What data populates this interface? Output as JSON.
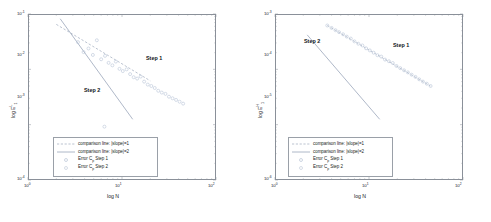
{
  "figure": {
    "background": "#ffffff",
    "axis_color": "#8a9099",
    "marker_color": "#b9c4d6",
    "line1_color": "#aab4c4",
    "line2_color": "#9aa6ba"
  },
  "panels": [
    {
      "id": "left",
      "xlabel": "log N",
      "ylabel_text": "log E",
      "ylabel_sup": "L",
      "ylabel_sub": "1",
      "xticks": [
        "10",
        "10",
        "10"
      ],
      "xtick_exponents": [
        "0",
        "1",
        "2"
      ],
      "yticks": [
        "10",
        "10",
        "10",
        "10"
      ],
      "ytick_exponents": [
        "-1",
        "-2",
        "-3",
        "-4"
      ],
      "annotations": [
        {
          "name": "step-1-annotation",
          "label": "Step 1"
        },
        {
          "name": "step-2-annotation",
          "label": "Step 2"
        }
      ],
      "legend": [
        {
          "label": "comparison line: |slope|=1",
          "key": "dashed-line-key"
        },
        {
          "label": "comparison line: |slope|=2",
          "key": "solid-line-key"
        },
        {
          "label_pre": "Error C",
          "label_sub": "p",
          "label_post": " Step 1",
          "key": "circle-marker-key"
        },
        {
          "label_pre": "Error C",
          "label_sub": "p",
          "label_post": " Step 2",
          "key": "circle-marker-key"
        }
      ]
    },
    {
      "id": "right",
      "xlabel": "log N",
      "ylabel_text": "log E",
      "ylabel_sup": "H",
      "ylabel_sub": "1",
      "xticks": [
        "10",
        "10",
        "10"
      ],
      "xtick_exponents": [
        "0",
        "1",
        "2"
      ],
      "yticks": [
        "10",
        "10",
        "10",
        "10"
      ],
      "ytick_exponents": [
        "-3",
        "-4",
        "-5",
        "-6"
      ],
      "annotations": [
        {
          "name": "step-1-annotation",
          "label": "Step 1"
        },
        {
          "name": "step-2-annotation",
          "label": "Step 2"
        }
      ],
      "legend": [
        {
          "label": "comparison line: |slope|=1",
          "key": "dashed-line-key"
        },
        {
          "label": "comparison line: |slope|=2",
          "key": "solid-line-key"
        },
        {
          "label_pre": "Error C",
          "label_sub": "p",
          "label_post": " Step 1",
          "key": "circle-marker-key"
        },
        {
          "label_pre": "Error C",
          "label_sub": "p",
          "label_post": " Step 2",
          "key": "circle-marker-key"
        }
      ]
    }
  ],
  "chart_data": [
    {
      "type": "scatter",
      "title": "",
      "xlabel": "log N",
      "ylabel": "log E^L_1",
      "xscale": "log",
      "yscale": "log",
      "xlim": [
        1,
        100
      ],
      "ylim": [
        0.0001,
        0.1
      ],
      "grid": false,
      "legend_position": "lower-left-inside",
      "annotations": [
        {
          "text": "Step 1",
          "x": 18,
          "y": 0.018
        },
        {
          "text": "Step 2",
          "x": 4.2,
          "y": 0.0075
        }
      ],
      "series": [
        {
          "name": "comparison line: |slope|=1",
          "type": "line",
          "style": "dashed",
          "x": [
            2.0,
            20.0
          ],
          "y": [
            0.065,
            0.0062
          ]
        },
        {
          "name": "comparison line: |slope|=2",
          "type": "line",
          "style": "solid",
          "x": [
            2.2,
            13.0
          ],
          "y": [
            0.082,
            0.00125
          ]
        },
        {
          "name": "Error C_p Step 1",
          "type": "scatter",
          "marker": "circle",
          "x": [
            3.4,
            3.9,
            4.4,
            4.9,
            5.4,
            6.0,
            6.6,
            7.2,
            7.9,
            8.6,
            9.4,
            10.2,
            11.2,
            12.2,
            13.3,
            14.5,
            15.8,
            17.2,
            18.8,
            20.5,
            22.3,
            24.3,
            26.5,
            29.0,
            31.6,
            34.5,
            37.6,
            41.0,
            44.7
          ],
          "y": [
            0.031,
            0.0205,
            0.0238,
            0.0182,
            0.0335,
            0.0152,
            0.0175,
            0.0131,
            0.0118,
            0.0138,
            0.0102,
            0.0093,
            0.01,
            0.0082,
            0.0072,
            0.0068,
            0.0074,
            0.006,
            0.0053,
            0.005,
            0.0046,
            0.0041,
            0.0038,
            0.0036,
            0.0032,
            0.003,
            0.0028,
            0.0026,
            0.0024
          ]
        },
        {
          "name": "Error C_p Step 2",
          "type": "scatter",
          "marker": "circle",
          "x": [
            6.5,
            9.0,
            11.5
          ],
          "y": [
            0.00092,
            0.00046,
            0.0003
          ]
        }
      ]
    },
    {
      "type": "scatter",
      "title": "",
      "xlabel": "log N",
      "ylabel": "log E^H_1",
      "xscale": "log",
      "yscale": "log",
      "xlim": [
        1,
        100
      ],
      "ylim": [
        1e-06,
        0.001
      ],
      "grid": false,
      "legend_position": "lower-left-inside",
      "annotations": [
        {
          "text": "Step 1",
          "x": 16,
          "y": 0.00035
        },
        {
          "text": "Step 2",
          "x": 2.6,
          "y": 0.0004
        }
      ],
      "series": [
        {
          "name": "comparison line: |slope|=1",
          "type": "line",
          "style": "dashed",
          "x": [
            3.6,
            45.0
          ],
          "y": [
            0.00062,
            5e-05
          ]
        },
        {
          "name": "comparison line: |slope|=2",
          "type": "line",
          "style": "solid",
          "x": [
            2.2,
            13.0
          ],
          "y": [
            0.00042,
            1.25e-05
          ]
        },
        {
          "name": "Error C_p Step 1",
          "type": "scatter",
          "marker": "circle",
          "x": [
            3.6,
            4.0,
            4.4,
            4.8,
            5.3,
            5.8,
            6.4,
            7.0,
            7.7,
            8.5,
            9.3,
            10.2,
            11.2,
            12.3,
            13.5,
            14.8,
            16.3,
            17.9,
            19.6,
            21.5,
            23.6,
            25.9,
            28.4,
            31.2,
            34.2,
            37.5,
            41.2,
            45.2
          ],
          "y": [
            0.00062,
            0.00056,
            0.00051,
            0.00047,
            0.00043,
            0.00039,
            0.00036,
            0.00032,
            0.00029,
            0.00027,
            0.00024,
            0.00022,
            0.0002,
            0.00018,
            0.00017,
            0.00015,
            0.00014,
            0.00013,
            0.000115,
            0.000105,
            9.6e-05,
            8.8e-05,
            8e-05,
            7.3e-05,
            6.6e-05,
            6e-05,
            5.5e-05,
            5e-05
          ]
        },
        {
          "name": "Error C_p Step 2",
          "type": "scatter",
          "marker": "circle",
          "x": [],
          "y": []
        }
      ]
    }
  ]
}
